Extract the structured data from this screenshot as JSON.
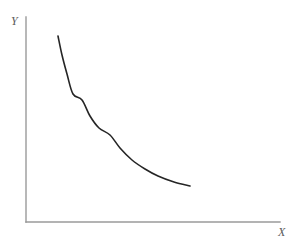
{
  "figure": {
    "background_color": "#ffffff",
    "width": 295,
    "height": 246,
    "axis_color": "#9a9a9a",
    "curve_color": "#252525",
    "label_color": "#5a5a5a"
  },
  "chart_data": {
    "type": "line",
    "title": "",
    "subtitle": "",
    "xlabel": "X",
    "ylabel": "Y",
    "legend": [],
    "legend_position": "none",
    "grid": false,
    "axis_ticks": false,
    "xlim": [
      0,
      1
    ],
    "ylim": [
      0,
      1
    ],
    "series": [
      {
        "name": "curve",
        "color": "#252525",
        "line_width": 1.6,
        "x": [
          0.155,
          0.185,
          0.22,
          0.265,
          0.33,
          0.4,
          0.47,
          0.545,
          0.62,
          0.7,
          0.78,
          0.85,
          0.93,
          1.0
        ],
        "y": [
          0.906,
          0.82,
          0.73,
          0.64,
          0.545,
          0.472,
          0.415,
          0.362,
          0.318,
          0.277,
          0.242,
          0.215,
          0.193,
          0.176
        ],
        "pixel_points": [
          [
            58,
            36
          ],
          [
            62,
            55
          ],
          [
            67,
            74
          ],
          [
            73,
            94
          ],
          [
            82,
            100
          ],
          [
            90,
            116
          ],
          [
            99,
            128
          ],
          [
            110,
            135
          ],
          [
            120,
            148
          ],
          [
            132,
            160
          ],
          [
            145,
            169
          ],
          [
            158,
            176
          ],
          [
            174,
            182
          ],
          [
            190,
            186
          ]
        ]
      }
    ]
  },
  "axes": {
    "y_axis": {
      "x": 26,
      "y_top": 17,
      "y_bottom": 222
    },
    "x_axis": {
      "y": 222,
      "x_left": 26,
      "x_right": 280
    }
  },
  "labels": {
    "y": "Y",
    "x": "X"
  }
}
